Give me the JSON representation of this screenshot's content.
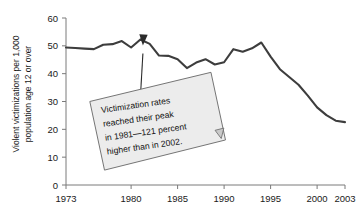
{
  "chart_data": {
    "type": "line",
    "title": "",
    "xlabel": "",
    "ylabel": "Violent victimizations per 1,000 population age 12 or over",
    "ylabel_lines": [
      "Violent victimizations per 1,000",
      "population age 12 or over"
    ],
    "xlim": [
      1973,
      2003
    ],
    "ylim": [
      0,
      60
    ],
    "ytick_values": [
      0,
      10,
      20,
      30,
      40,
      50,
      60
    ],
    "ytick_labels": [
      "0",
      "10",
      "20",
      "30",
      "40",
      "50",
      "60"
    ],
    "xtick_values": [
      1973,
      1980,
      1985,
      1990,
      1995,
      2000,
      2003
    ],
    "xtick_labels": [
      "1973",
      "1980",
      "1985",
      "1990",
      "1995",
      "2000",
      "2003"
    ],
    "grid": false,
    "legend": null,
    "series": [
      {
        "name": "Violent victimization rate",
        "color": "#3d3d3d",
        "x": [
          1973,
          1974,
          1975,
          1976,
          1977,
          1978,
          1979,
          1980,
          1981,
          1982,
          1983,
          1984,
          1985,
          1986,
          1987,
          1988,
          1989,
          1990,
          1991,
          1992,
          1993,
          1994,
          1995,
          1996,
          1997,
          1998,
          1999,
          2000,
          2001,
          2002,
          2003
        ],
        "values": [
          49.4,
          49.2,
          49.0,
          48.8,
          50.4,
          50.6,
          51.7,
          49.4,
          52.3,
          50.7,
          46.5,
          46.4,
          45.2,
          42.0,
          44.0,
          45.2,
          43.3,
          44.1,
          48.8,
          47.9,
          49.1,
          51.2,
          46.1,
          41.6,
          38.8,
          36.0,
          32.1,
          27.9,
          25.1,
          23.1,
          22.6
        ],
        "annotation_peak_year": 1981,
        "annotation_peak_value": 52.3
      }
    ],
    "annotations": [
      {
        "name": "peak-callout",
        "text_lines": [
          "Victimization rates",
          "reached their peak",
          "in 1981—121 percent",
          "higher than in 2002."
        ],
        "points_to_year": 1981,
        "points_to_value": 52.3,
        "box_fill": "#ececec",
        "box_stroke": "#6e6e6e",
        "rotation_deg": -8
      }
    ]
  }
}
